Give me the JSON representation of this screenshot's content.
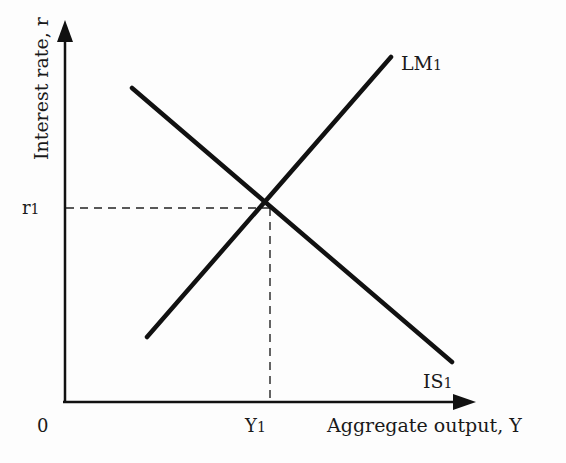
{
  "diagram": {
    "y_axis": {
      "label": "Interest rate, r"
    },
    "x_axis": {
      "label": "Aggregate output, Y"
    },
    "origin_label": "0",
    "curves": [
      {
        "name": "LM",
        "label_main": "LM",
        "label_sub": "1"
      },
      {
        "name": "IS",
        "label_main": "IS",
        "label_sub": "1"
      }
    ],
    "equilibrium": {
      "r_label_main": "r",
      "r_label_sub": "1",
      "y_label_main": "Y",
      "y_label_sub": "1"
    },
    "colors": {
      "line": "#111111",
      "dashed": "#222222",
      "background": "#fdfdfd"
    }
  }
}
